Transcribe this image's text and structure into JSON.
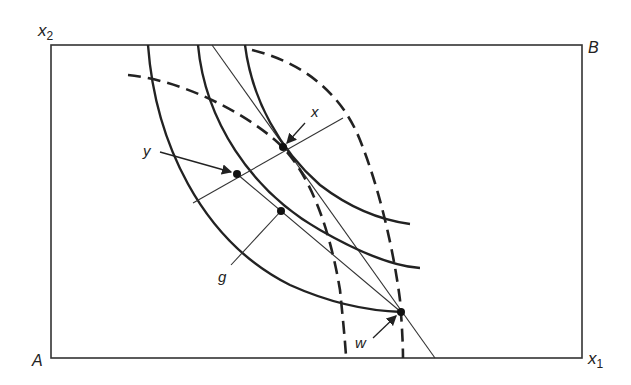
{
  "diagram": {
    "type": "edgeworth-box",
    "colors": {
      "ink": "#222222",
      "background": "#ffffff"
    },
    "corners": {
      "bottom_left": "A",
      "top_right": "B"
    },
    "axes": {
      "vertical": {
        "base": "x",
        "subscript": "2"
      },
      "horizontal": {
        "base": "x",
        "subscript": "1"
      }
    },
    "points": {
      "x": "x",
      "y": "y",
      "g": "g",
      "w": "w"
    },
    "elements": {
      "solid_indifference_curves": 3,
      "dashed_indifference_curves": 2,
      "straight_line": 1,
      "marked_points": 4
    }
  }
}
